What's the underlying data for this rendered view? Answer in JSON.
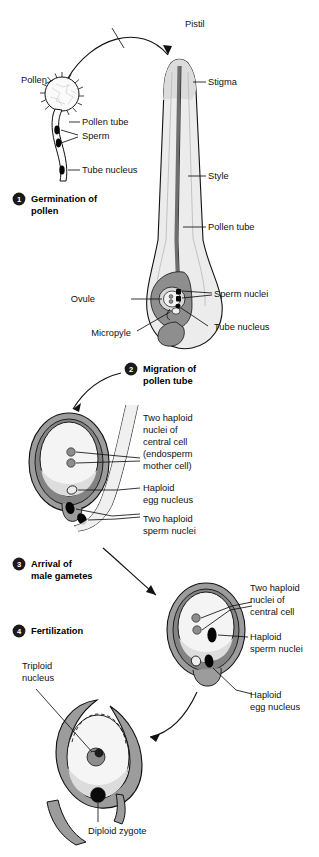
{
  "figure": {
    "colors": {
      "outline": "#111111",
      "integument_gray": "#9a9a9a",
      "integument_dark": "#7d7d7d",
      "nucellus_gray": "#8c8c8c",
      "embryo_sac_light": "#f2f2f2",
      "style_fill": "#e6e6e6",
      "nucleus_black": "#050505",
      "nucleus_mid_gray": "#8d8d8d",
      "step_badge": "#1a1a1a",
      "background": "#ffffff"
    }
  },
  "steps": [
    {
      "num": "1",
      "label_line1": "Germination of",
      "label_line2": "pollen"
    },
    {
      "num": "2",
      "label_line1": "Migration of",
      "label_line2": "pollen tube"
    },
    {
      "num": "3",
      "label_line1": "Arrival of",
      "label_line2": "male gametes"
    },
    {
      "num": "4",
      "label_line1": "Fertilization",
      "label_line2": ""
    }
  ],
  "stage1": {
    "pistil": "Pistil",
    "pollen": "Pollen",
    "pollen_tube": "Pollen tube",
    "sperm": "Sperm",
    "tube_nucleus": "Tube nucleus",
    "stigma": "Stigma",
    "style": "Style",
    "pollen_tube_long": "Pollen tube",
    "ovule": "Ovule",
    "micropyle": "Micropyle",
    "sperm_nuclei": "Sperm nuclei",
    "tube_nucleus_2": "Tube nucleus"
  },
  "stage2": {
    "central_nuclei_l1": "Two haploid",
    "central_nuclei_l2": "nuclei of",
    "central_nuclei_l3": "central cell",
    "central_nuclei_l4": "(endosperm",
    "central_nuclei_l5": "mother cell)",
    "egg_l1": "Haploid",
    "egg_l2": "egg nucleus",
    "sperm_l1": "Two haploid",
    "sperm_l2": "sperm nuclei"
  },
  "stage3": {
    "central_l1": "Two haploid",
    "central_l2": "nuclei of",
    "central_l3": "central cell",
    "sperm_l1": "Haploid",
    "sperm_l2": "sperm nuclei",
    "egg_l1": "Haploid",
    "egg_l2": "egg nucleus"
  },
  "stage4": {
    "triploid_l1": "Triploid",
    "triploid_l2": "nucleus",
    "zygote": "Diploid zygote"
  }
}
